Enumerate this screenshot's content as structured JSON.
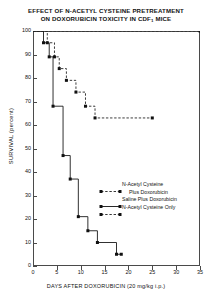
{
  "title": {
    "line1": "EFFECT OF N-ACETYL CYSTEINE PRETREATMENT",
    "line2_pre": "ON DOXORUBICIN TOXICITY IN CDF",
    "line2_sub": "1",
    "line2_post": " MICE"
  },
  "axes": {
    "ylabel": "SURVIVAL (percent)",
    "xlabel": "DAYS AFTER DOXORUBICIN (20 mg/kg i.p.)",
    "yticks": [
      "0",
      "10",
      "20",
      "30",
      "40",
      "50",
      "60",
      "70",
      "80",
      "90",
      "100"
    ],
    "xticks": [
      "0",
      "5",
      "10",
      "15",
      "20",
      "25",
      "30",
      "35"
    ]
  },
  "legend": {
    "items": [
      {
        "label": "N-Acetyl Cysteine",
        "label_cont": "Plus Doxorubicin",
        "style": "dashed",
        "marker": "square"
      },
      {
        "label": "Saline Plus Doxorubicin",
        "label_cont": "",
        "style": "solid",
        "marker": "square"
      },
      {
        "label": "N-Acetyl Cysteine Only",
        "label_cont": "",
        "style": "dashed",
        "marker": "square"
      }
    ]
  },
  "chart_data": {
    "type": "line",
    "title": "EFFECT OF N-ACETYL CYSTEINE PRETREATMENT ON DOXORUBICIN TOXICITY IN CDF1 MICE",
    "xlabel": "DAYS AFTER DOXORUBICIN (20 mg/kg i.p.)",
    "ylabel": "SURVIVAL (percent)",
    "xlim": [
      0,
      35
    ],
    "ylim": [
      0,
      100
    ],
    "xticks": [
      0,
      5,
      10,
      15,
      20,
      25,
      30,
      35
    ],
    "yticks": [
      0,
      10,
      20,
      30,
      40,
      50,
      60,
      70,
      80,
      90,
      100
    ],
    "grid": false,
    "legend_position": "middle-right",
    "series": [
      {
        "name": "N-Acetyl Cysteine Plus Doxorubicin",
        "style": "dashed",
        "marker": "filled-square",
        "points": [
          {
            "x": 0,
            "y": 100
          },
          {
            "x": 3,
            "y": 100
          },
          {
            "x": 3,
            "y": 95
          },
          {
            "x": 4.5,
            "y": 95
          },
          {
            "x": 4.5,
            "y": 89
          },
          {
            "x": 5.5,
            "y": 89
          },
          {
            "x": 5.5,
            "y": 84
          },
          {
            "x": 7,
            "y": 84
          },
          {
            "x": 7,
            "y": 79
          },
          {
            "x": 9,
            "y": 79
          },
          {
            "x": 9,
            "y": 74
          },
          {
            "x": 11,
            "y": 74
          },
          {
            "x": 11,
            "y": 68
          },
          {
            "x": 13,
            "y": 68
          },
          {
            "x": 13,
            "y": 63
          },
          {
            "x": 17,
            "y": 63
          },
          {
            "x": 25,
            "y": 63
          }
        ]
      },
      {
        "name": "Saline Plus Doxorubicin",
        "style": "solid",
        "marker": "filled-square",
        "points": [
          {
            "x": 0,
            "y": 100
          },
          {
            "x": 2.2,
            "y": 100
          },
          {
            "x": 2.2,
            "y": 95
          },
          {
            "x": 3.4,
            "y": 95
          },
          {
            "x": 3.4,
            "y": 89
          },
          {
            "x": 4.2,
            "y": 89
          },
          {
            "x": 4.2,
            "y": 68
          },
          {
            "x": 6.3,
            "y": 68
          },
          {
            "x": 6.3,
            "y": 47
          },
          {
            "x": 7.8,
            "y": 47
          },
          {
            "x": 7.8,
            "y": 37
          },
          {
            "x": 9.5,
            "y": 37
          },
          {
            "x": 9.5,
            "y": 21
          },
          {
            "x": 11.5,
            "y": 21
          },
          {
            "x": 11.5,
            "y": 15
          },
          {
            "x": 13.5,
            "y": 15
          },
          {
            "x": 13.5,
            "y": 10
          },
          {
            "x": 17.5,
            "y": 10
          },
          {
            "x": 17.5,
            "y": 5
          },
          {
            "x": 18.5,
            "y": 5
          }
        ]
      },
      {
        "name": "N-Acetyl Cysteine Only",
        "style": "dashed",
        "marker": "filled-square",
        "points": [
          {
            "x": 0,
            "y": 100
          },
          {
            "x": 35,
            "y": 100
          }
        ]
      }
    ]
  }
}
